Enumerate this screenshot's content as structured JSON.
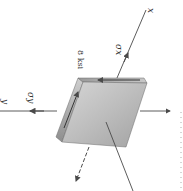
{
  "figure": {
    "labels": {
      "x_axis": "x",
      "y_axis": "y",
      "sigma_x": "σx",
      "sigma_y": "σy",
      "shear_stress": "8 ksi"
    },
    "colors": {
      "block_light": "#e4e4e4",
      "block_mid": "#b8b8b8",
      "block_dark": "#8c8c8c",
      "line": "#4a4a4a",
      "background": "#ffffff"
    }
  }
}
